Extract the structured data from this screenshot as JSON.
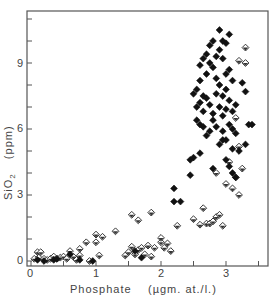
{
  "chart_data": {
    "type": "scatter",
    "title": "",
    "xlabel": "Phosphate",
    "xunit": "(µgm. at./l.)",
    "ylabel": "SiO2",
    "yunit": "(ppm)",
    "xlim": [
      -0.05,
      3.65
    ],
    "ylim": [
      -0.3,
      11.3
    ],
    "xticks": [
      "0",
      "1",
      "2",
      "3"
    ],
    "yticks": [
      "0",
      "3",
      "6",
      "9"
    ],
    "grid": false,
    "legend": null,
    "series": [
      {
        "name": "open diamonds",
        "marker": "open-diamond",
        "points": [
          [
            0.05,
            0.1
          ],
          [
            0.1,
            0.4
          ],
          [
            0.15,
            0.4
          ],
          [
            0.12,
            0.15
          ],
          [
            0.2,
            0.1
          ],
          [
            0.25,
            0.05
          ],
          [
            0.3,
            0.1
          ],
          [
            0.35,
            0.2
          ],
          [
            0.4,
            0.1
          ],
          [
            0.45,
            0.15
          ],
          [
            0.5,
            0.2
          ],
          [
            0.55,
            0.1
          ],
          [
            0.6,
            0.45
          ],
          [
            0.65,
            0.2
          ],
          [
            0.7,
            0.05
          ],
          [
            0.75,
            0.55
          ],
          [
            0.75,
            0.25
          ],
          [
            0.85,
            0.85
          ],
          [
            0.9,
            0.0
          ],
          [
            1.0,
            1.2
          ],
          [
            1.0,
            0.85
          ],
          [
            1.05,
            0.25
          ],
          [
            1.1,
            1.1
          ],
          [
            1.3,
            1.35
          ],
          [
            1.45,
            0.25
          ],
          [
            1.5,
            0.4
          ],
          [
            1.55,
            0.65
          ],
          [
            1.6,
            0.3
          ],
          [
            1.65,
            0.5
          ],
          [
            1.7,
            0.6
          ],
          [
            1.75,
            0.3
          ],
          [
            1.8,
            0.7
          ],
          [
            1.85,
            0.2
          ],
          [
            1.9,
            0.6
          ],
          [
            2.0,
            0.85
          ],
          [
            2.0,
            1.05
          ],
          [
            2.05,
            0.6
          ],
          [
            2.1,
            0.8
          ],
          [
            2.15,
            0.45
          ],
          [
            1.55,
            2.1
          ],
          [
            1.65,
            1.85
          ],
          [
            1.85,
            2.2
          ],
          [
            2.25,
            1.6
          ],
          [
            2.5,
            1.9
          ],
          [
            2.6,
            1.65
          ],
          [
            2.65,
            2.4
          ],
          [
            2.7,
            1.7
          ],
          [
            2.75,
            1.7
          ],
          [
            2.8,
            1.8
          ],
          [
            2.85,
            2.0
          ],
          [
            2.9,
            2.1
          ],
          [
            2.95,
            1.6
          ],
          [
            3.0,
            3.5
          ],
          [
            2.85,
            4.0
          ],
          [
            3.1,
            3.3
          ],
          [
            3.05,
            4.5
          ],
          [
            3.15,
            3.8
          ],
          [
            3.2,
            3.0
          ],
          [
            3.25,
            4.2
          ],
          [
            3.2,
            5.2
          ],
          [
            3.15,
            6.5
          ],
          [
            3.3,
            9.0
          ],
          [
            3.2,
            9.1
          ],
          [
            3.3,
            9.7
          ]
        ]
      },
      {
        "name": "filled diamonds",
        "marker": "filled-diamond",
        "points": [
          [
            0.1,
            0.05
          ],
          [
            0.2,
            0.0
          ],
          [
            0.35,
            0.05
          ],
          [
            0.4,
            0.1
          ],
          [
            0.6,
            0.3
          ],
          [
            0.75,
            0.05
          ],
          [
            0.95,
            0.0
          ],
          [
            1.6,
            0.45
          ],
          [
            1.7,
            0.15
          ],
          [
            2.2,
            3.3
          ],
          [
            2.2,
            2.7
          ],
          [
            2.3,
            2.7
          ],
          [
            2.45,
            4.6
          ],
          [
            2.45,
            3.9
          ],
          [
            2.5,
            4.7
          ],
          [
            2.6,
            4.9
          ],
          [
            2.6,
            6.2
          ],
          [
            2.7,
            5.7
          ],
          [
            2.75,
            5.9
          ],
          [
            2.8,
            6.4
          ],
          [
            2.9,
            5.3
          ],
          [
            2.95,
            5.5
          ],
          [
            2.55,
            7.8
          ],
          [
            2.6,
            8.2
          ],
          [
            2.65,
            7.5
          ],
          [
            2.7,
            8.5
          ],
          [
            2.75,
            9.0
          ],
          [
            2.8,
            8.8
          ],
          [
            2.85,
            9.3
          ],
          [
            2.9,
            9.6
          ],
          [
            2.95,
            9.2
          ],
          [
            3.0,
            9.9
          ],
          [
            3.05,
            10.3
          ],
          [
            2.7,
            9.4
          ],
          [
            2.75,
            9.8
          ],
          [
            2.85,
            8.3
          ],
          [
            2.9,
            8.0
          ],
          [
            2.95,
            7.5
          ],
          [
            2.5,
            7.6
          ],
          [
            2.55,
            7.0
          ],
          [
            2.6,
            7.2
          ],
          [
            2.65,
            6.8
          ],
          [
            2.7,
            7.4
          ],
          [
            2.75,
            7.1
          ],
          [
            2.8,
            6.7
          ],
          [
            2.85,
            7.6
          ],
          [
            2.9,
            7.0
          ],
          [
            2.95,
            6.6
          ],
          [
            3.0,
            6.9
          ],
          [
            3.05,
            6.2
          ],
          [
            3.1,
            6.0
          ],
          [
            3.15,
            5.8
          ],
          [
            2.6,
            8.9
          ],
          [
            2.65,
            9.2
          ],
          [
            2.8,
            10.0
          ],
          [
            2.9,
            10.5
          ],
          [
            2.95,
            10.0
          ],
          [
            3.0,
            8.5
          ],
          [
            3.05,
            8.7
          ],
          [
            3.1,
            8.2
          ],
          [
            3.0,
            7.8
          ],
          [
            3.05,
            7.3
          ],
          [
            3.1,
            6.8
          ],
          [
            3.15,
            7.1
          ],
          [
            2.55,
            6.4
          ],
          [
            2.65,
            6.1
          ],
          [
            2.85,
            6.1
          ],
          [
            2.95,
            5.9
          ],
          [
            3.0,
            5.5
          ],
          [
            3.1,
            5.1
          ],
          [
            3.2,
            5.0
          ],
          [
            3.25,
            8.1
          ],
          [
            3.3,
            7.7
          ],
          [
            3.35,
            6.2
          ],
          [
            3.4,
            6.2
          ],
          [
            3.3,
            5.3
          ],
          [
            3.0,
            4.6
          ],
          [
            3.05,
            4.3
          ],
          [
            2.8,
            4.2
          ],
          [
            3.1,
            4.0
          ],
          [
            3.15,
            3.8
          ]
        ]
      }
    ]
  },
  "axes": {
    "x_label": "Phosphate",
    "x_unit": "(µgm. at./l.)",
    "y_label_main": "SiO",
    "y_label_sub": "2",
    "y_unit": "(ppm)",
    "x_ticks": [
      {
        "label": "0",
        "px": 31
      },
      {
        "label": "1",
        "px": 96
      },
      {
        "label": "2",
        "px": 161
      },
      {
        "label": "3",
        "px": 226
      }
    ],
    "y_ticks": [
      {
        "label": "0",
        "px": 261
      },
      {
        "label": "3",
        "px": 195
      },
      {
        "label": "6",
        "px": 129
      },
      {
        "label": "9",
        "px": 64
      }
    ]
  }
}
